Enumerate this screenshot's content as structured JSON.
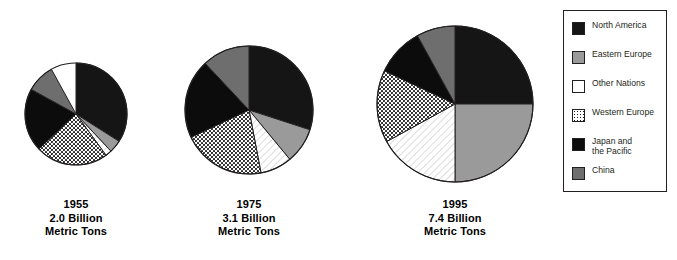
{
  "chart_data": {
    "type": "pie",
    "title": "",
    "unit": "Billion Metric Tons",
    "legend_position": "right",
    "grid": false,
    "series_labels": [
      "North America",
      "Eastern Europe",
      "Other Nations",
      "Western Europe",
      "Japan and the Pacific",
      "China"
    ],
    "colors": [
      "#151515",
      "#9a9a9a",
      "#ffffff",
      "#ffffff",
      "#0c0c0c",
      "#6e6e6e"
    ],
    "patterns": [
      "solid-black",
      "solid-gray",
      "blank-white",
      "dotted",
      "solid-black",
      "solid-dark-gray"
    ],
    "charts": [
      {
        "year": "1955",
        "total": 2.0,
        "total_label": "2.0 Billion",
        "unit_label": "Metric Tons",
        "radius_px": 51,
        "slices": [
          {
            "label": "North America",
            "percent": 34.0,
            "pattern": "solid-black"
          },
          {
            "label": "Eastern Europe",
            "percent": 4.0,
            "pattern": "solid-gray"
          },
          {
            "label": "Other Nations",
            "percent": 2.0,
            "pattern": "blank-white"
          },
          {
            "label": "Western Europe",
            "percent": 23.0,
            "pattern": "dotted"
          },
          {
            "label": "Japan and the Pacific",
            "percent": 20.0,
            "pattern": "solid-black"
          },
          {
            "label": "China",
            "percent": 9.0,
            "pattern": "solid-dark-gray"
          }
        ]
      },
      {
        "year": "1975",
        "total": 3.1,
        "total_label": "3.1 Billion",
        "unit_label": "Metric Tons",
        "radius_px": 64,
        "slices": [
          {
            "label": "North America",
            "percent": 30.0,
            "pattern": "solid-black"
          },
          {
            "label": "Eastern Europe",
            "percent": 9.0,
            "pattern": "solid-gray"
          },
          {
            "label": "Other Nations",
            "percent": 8.0,
            "pattern": "blank-white"
          },
          {
            "label": "Western Europe",
            "percent": 21.0,
            "pattern": "dotted"
          },
          {
            "label": "Japan and the Pacific",
            "percent": 20.0,
            "pattern": "solid-black"
          },
          {
            "label": "China",
            "percent": 12.0,
            "pattern": "solid-dark-gray"
          }
        ]
      },
      {
        "year": "1995",
        "total": 7.4,
        "total_label": "7.4 Billion",
        "unit_label": "Metric Tons",
        "radius_px": 78,
        "slices": [
          {
            "label": "North America",
            "percent": 25.0,
            "pattern": "solid-black"
          },
          {
            "label": "Eastern Europe",
            "percent": 25.0,
            "pattern": "solid-gray"
          },
          {
            "label": "Other Nations",
            "percent": 17.0,
            "pattern": "blank-white"
          },
          {
            "label": "Western Europe",
            "percent": 15.0,
            "pattern": "dotted"
          },
          {
            "label": "Japan and the Pacific",
            "percent": 10.0,
            "pattern": "solid-black"
          },
          {
            "label": "China",
            "percent": 8.0,
            "pattern": "solid-dark-gray"
          }
        ]
      }
    ]
  },
  "legend": {
    "items": [
      {
        "label": "North America",
        "swatch": "solid-black"
      },
      {
        "label": "Eastern Europe",
        "swatch": "solid-gray"
      },
      {
        "label": "Other Nations",
        "swatch": "blank-white"
      },
      {
        "label": "Western Europe",
        "swatch": "dotted"
      },
      {
        "label": "Japan and\nthe Pacific",
        "swatch": "solid-black"
      },
      {
        "label": "China",
        "swatch": "solid-dark-gray"
      }
    ]
  },
  "captions": {
    "chart1": {
      "year": "1955",
      "amount": "2.0 Billion",
      "unit": "Metric Tons"
    },
    "chart2": {
      "year": "1975",
      "amount": "3.1 Billion",
      "unit": "Metric Tons"
    },
    "chart3": {
      "year": "1995",
      "amount": "7.4 Billion",
      "unit": "Metric Tons"
    }
  }
}
